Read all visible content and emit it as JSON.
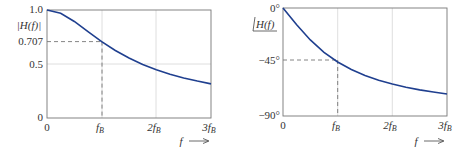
{
  "chart_data": [
    {
      "type": "line",
      "title": "",
      "ylabel": "|H(f)|",
      "xlabel": "f",
      "xlim": [
        0,
        3
      ],
      "ylim": [
        0,
        1.0
      ],
      "x_ticks": [
        "0",
        "f_B",
        "2f_B",
        "3f_B"
      ],
      "y_ticks": [
        "0",
        "0.5",
        "0.707",
        "1.0"
      ],
      "grid": true,
      "annotations": [
        {
          "type": "dashed-guide",
          "x": 1,
          "y": 0.707
        }
      ],
      "series": [
        {
          "name": "|H(f)|",
          "color": "#1f3f8f",
          "x": [
            0,
            0.25,
            0.5,
            0.75,
            1.0,
            1.25,
            1.5,
            1.75,
            2.0,
            2.25,
            2.5,
            2.75,
            3.0
          ],
          "values": [
            1.0,
            0.97,
            0.894,
            0.8,
            0.707,
            0.625,
            0.555,
            0.496,
            0.447,
            0.406,
            0.371,
            0.342,
            0.316
          ]
        }
      ]
    },
    {
      "type": "line",
      "title": "",
      "ylabel": "∠H(f)",
      "xlabel": "f",
      "xlim": [
        0,
        3
      ],
      "ylim": [
        -90,
        0
      ],
      "x_ticks": [
        "0",
        "f_B",
        "2f_B",
        "3f_B"
      ],
      "y_ticks": [
        "-90°",
        "-45°",
        "0°"
      ],
      "grid": true,
      "annotations": [
        {
          "type": "dashed-guide",
          "x": 1,
          "y": -45
        }
      ],
      "series": [
        {
          "name": "∠H(f)",
          "color": "#1f3f8f",
          "x": [
            0,
            0.25,
            0.5,
            0.75,
            1.0,
            1.25,
            1.5,
            1.75,
            2.0,
            2.25,
            2.5,
            2.75,
            3.0
          ],
          "values": [
            0,
            -14.0,
            -26.6,
            -36.9,
            -45.0,
            -51.3,
            -56.3,
            -60.3,
            -63.4,
            -66.0,
            -68.2,
            -70.0,
            -71.6
          ]
        }
      ]
    }
  ],
  "left": {
    "ylabel_main": "|H(f)|",
    "yticks": {
      "t10": "1.0",
      "t0707": "0.707",
      "t05": "0.5",
      "t0": "0"
    },
    "xticks": {
      "t0": "0",
      "t1": "f",
      "t1sub": "B",
      "t2": "2f",
      "t2sub": "B",
      "t3": "3f",
      "t3sub": "B"
    },
    "xlabel": "f",
    "arrow": "⟶"
  },
  "right": {
    "ylabel_main": "H(f)",
    "yticks": {
      "t0": "0°",
      "t45": "−45°",
      "t90": "−90°"
    },
    "xticks": {
      "t0": "0",
      "t1": "f",
      "t1sub": "B",
      "t2": "2f",
      "t2sub": "B",
      "t3": "3f",
      "t3sub": "B"
    },
    "xlabel": "f",
    "arrow": "⟶"
  }
}
